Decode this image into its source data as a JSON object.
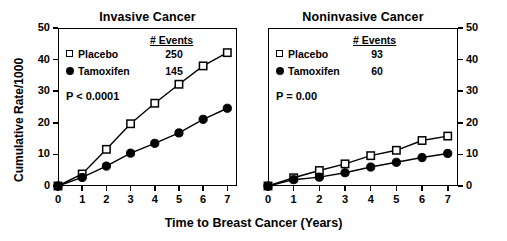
{
  "figure": {
    "xlabel": "Time to Breast Cancer (Years)",
    "ylabel": "Cumulative Rate/1000"
  },
  "panels": [
    {
      "id": "invasive",
      "title": "Invasive Cancer",
      "pvalue": "P < 0.0001",
      "events_header": "# Events",
      "legend": [
        {
          "label": "Placebo",
          "marker": "open-square",
          "events": "250"
        },
        {
          "label": "Tamoxifen",
          "marker": "filled-circle",
          "events": "145"
        }
      ],
      "yticks": [
        "0",
        "10",
        "20",
        "30",
        "40",
        "50"
      ],
      "xticks": [
        "0",
        "1",
        "2",
        "3",
        "4",
        "5",
        "6",
        "7"
      ],
      "axis_side": "left"
    },
    {
      "id": "noninvasive",
      "title": "Noninvasive Cancer",
      "pvalue": "P = 0.00",
      "events_header": "# Events",
      "legend": [
        {
          "label": "Placebo",
          "marker": "open-square",
          "events": "93"
        },
        {
          "label": "Tamoxifen",
          "marker": "filled-circle",
          "events": "60"
        }
      ],
      "yticks": [
        "0",
        "10",
        "20",
        "30",
        "40",
        "50"
      ],
      "xticks": [
        "0",
        "1",
        "2",
        "3",
        "4",
        "5",
        "6",
        "7"
      ],
      "axis_side": "right"
    }
  ],
  "chart_data": [
    {
      "type": "line",
      "title": "Invasive Cancer",
      "xlabel": "Time to Breast Cancer (Years)",
      "ylabel": "Cumulative Rate/1000",
      "x": [
        0,
        1,
        2,
        3,
        4,
        5,
        6,
        7
      ],
      "xlim": [
        0,
        7.4
      ],
      "ylim": [
        0,
        50
      ],
      "yticks": [
        0,
        10,
        20,
        30,
        40,
        50
      ],
      "xticks": [
        0,
        1,
        2,
        3,
        4,
        5,
        6,
        7
      ],
      "grid": false,
      "legend_position": "upper-left",
      "annotations": [
        "P < 0.0001",
        "# Events",
        "250",
        "145"
      ],
      "series": [
        {
          "name": "Placebo",
          "marker": "open-square",
          "events": 250,
          "values": [
            0,
            3.8,
            11.6,
            19.7,
            26.2,
            32.2,
            38.0,
            42.2
          ]
        },
        {
          "name": "Tamoxifen",
          "marker": "filled-circle",
          "events": 145,
          "values": [
            0,
            2.7,
            6.3,
            10.4,
            13.5,
            16.8,
            21.1,
            24.6
          ]
        }
      ]
    },
    {
      "type": "line",
      "title": "Noninvasive Cancer",
      "xlabel": "Time to Breast Cancer (Years)",
      "ylabel": "Cumulative Rate/1000",
      "x": [
        0,
        1,
        2,
        3,
        4,
        5,
        6,
        7
      ],
      "xlim": [
        0,
        7.4
      ],
      "ylim": [
        0,
        50
      ],
      "yticks": [
        0,
        10,
        20,
        30,
        40,
        50
      ],
      "xticks": [
        0,
        1,
        2,
        3,
        4,
        5,
        6,
        7
      ],
      "grid": false,
      "legend_position": "upper-left",
      "annotations": [
        "P = 0.00",
        "# Events",
        "93",
        "60"
      ],
      "series": [
        {
          "name": "Placebo",
          "marker": "open-square",
          "events": 93,
          "values": [
            0,
            2.6,
            4.9,
            7.0,
            9.6,
            11.3,
            14.4,
            15.8
          ]
        },
        {
          "name": "Tamoxifen",
          "marker": "filled-circle",
          "events": 60,
          "values": [
            0,
            2.0,
            2.8,
            4.2,
            6.0,
            7.5,
            9.0,
            10.3
          ]
        }
      ]
    }
  ]
}
